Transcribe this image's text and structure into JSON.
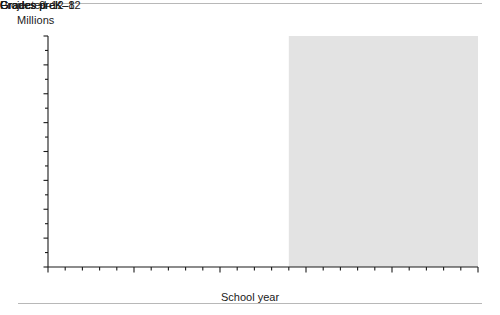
{
  "axis_unit_label": "Millions",
  "projected_label": "Projected",
  "xaxis_title": "School year",
  "ytick_labels": [
    "0",
    "10",
    "20",
    "30",
    "40",
    "50",
    "60",
    "70",
    "80"
  ],
  "xtick_labels": [
    "1997",
    "2002",
    "2007",
    "2012",
    "2017",
    "2022"
  ],
  "series_labels": {
    "prek12": "Grades preK–12",
    "prek8": "Grades preK–8",
    "g912": "Grades 9–12"
  },
  "colors": {
    "line_actual": "#000000",
    "line_projected": "#8c8c8c",
    "projected_band": "#e3e3e3",
    "axis": "#1a1a1a",
    "rule": "#b8b8b8"
  },
  "chart_data": {
    "type": "line",
    "title": "",
    "xlabel": "School year",
    "ylabel": "Millions",
    "xlim": [
      1997,
      2022
    ],
    "ylim": [
      0,
      80
    ],
    "ytick_interval": 10,
    "xtick_interval_labeled": 5,
    "xtick_interval_minor": 1,
    "grid": false,
    "legend": "inline-labels",
    "projection_start_year": 2011,
    "annotations": [
      {
        "text": "Projected",
        "x_range": [
          2011,
          2022
        ],
        "note": "shaded band covering projected years"
      }
    ],
    "x": [
      1997,
      1998,
      1999,
      2000,
      2001,
      2002,
      2003,
      2004,
      2005,
      2006,
      2007,
      2008,
      2009,
      2010,
      2011,
      2012,
      2013,
      2014,
      2015,
      2016,
      2017,
      2018,
      2019,
      2020,
      2021,
      2022
    ],
    "series": [
      {
        "name": "Grades preK–12",
        "style": "solid",
        "values": [
          51.9,
          52.2,
          52.6,
          53.0,
          53.5,
          53.8,
          54.1,
          54.4,
          54.6,
          54.8,
          55.0,
          55.1,
          54.9,
          54.7,
          54.6,
          54.8,
          55.0,
          55.2,
          55.4,
          55.6,
          55.9,
          56.1,
          56.4,
          56.6,
          56.9,
          57.2
        ]
      },
      {
        "name": "Grades preK–8",
        "style": "dotted",
        "values": [
          37.8,
          37.9,
          38.0,
          38.1,
          38.2,
          38.2,
          38.1,
          38.0,
          38.0,
          37.9,
          37.9,
          38.0,
          38.1,
          38.2,
          38.3,
          38.5,
          38.7,
          38.9,
          39.1,
          39.3,
          39.5,
          39.8,
          40.0,
          40.3,
          40.6,
          40.9
        ]
      },
      {
        "name": "Grades 9–12",
        "style": "dashed",
        "values": [
          14.1,
          14.3,
          14.6,
          14.9,
          15.2,
          15.6,
          16.0,
          16.4,
          16.6,
          16.9,
          17.1,
          17.1,
          16.8,
          16.5,
          16.3,
          16.3,
          16.3,
          16.3,
          16.3,
          16.3,
          16.4,
          16.3,
          16.4,
          16.3,
          16.3,
          16.3
        ]
      }
    ]
  }
}
